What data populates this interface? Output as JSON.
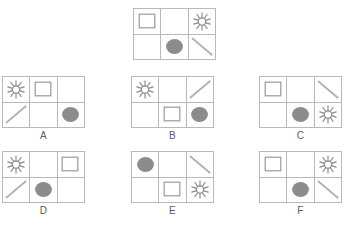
{
  "puzzle": {
    "type": "matrix-reasoning-shape-grid",
    "grid_columns": 3,
    "grid_rows": 2,
    "colors": {
      "background": "#ffffff",
      "grid_line": "#b9b9b9",
      "shape_outline": "#9a9a9a",
      "circle_fill": "#8c8c8c",
      "starburst_stroke": "#8a8a8a",
      "line_stroke": "#b0b0b0",
      "label_text": "#5c5c5c"
    },
    "icon_names": {
      "square": "square-outline-icon",
      "circle": "filled-circle-icon",
      "starburst": "starburst-icon",
      "line_down": "diagonal-line-down-icon",
      "line_up": "diagonal-line-up-icon",
      "empty": "empty-cell"
    },
    "reference": {
      "label": "",
      "name": "reference-panel",
      "cells": [
        "square",
        "empty",
        "starburst",
        "empty",
        "circle",
        "line_down"
      ]
    },
    "options": [
      {
        "label": "A",
        "name": "option-a",
        "cells": [
          "starburst",
          "square",
          "empty",
          "line_up",
          "empty",
          "circle"
        ]
      },
      {
        "label": "B",
        "name": "option-b",
        "cells": [
          "starburst",
          "empty",
          "line_up",
          "empty",
          "square",
          "circle"
        ]
      },
      {
        "label": "C",
        "name": "option-c",
        "cells": [
          "square",
          "empty",
          "line_down",
          "empty",
          "circle",
          "starburst"
        ]
      },
      {
        "label": "D",
        "name": "option-d",
        "cells": [
          "starburst",
          "empty",
          "square",
          "line_up",
          "circle",
          "empty"
        ]
      },
      {
        "label": "E",
        "name": "option-e",
        "cells": [
          "circle",
          "empty",
          "line_down",
          "empty",
          "square",
          "starburst"
        ]
      },
      {
        "label": "F",
        "name": "option-f",
        "cells": [
          "square",
          "empty",
          "starburst",
          "empty",
          "circle",
          "line_down"
        ]
      }
    ],
    "layout": {
      "panel_width": 83,
      "panel_height": 52,
      "reference_pos": {
        "x": 133,
        "y": 8
      },
      "option_positions": [
        {
          "x": 2,
          "y": 76
        },
        {
          "x": 131,
          "y": 76
        },
        {
          "x": 259,
          "y": 76
        },
        {
          "x": 2,
          "y": 151
        },
        {
          "x": 131,
          "y": 151
        },
        {
          "x": 259,
          "y": 151
        }
      ]
    }
  }
}
